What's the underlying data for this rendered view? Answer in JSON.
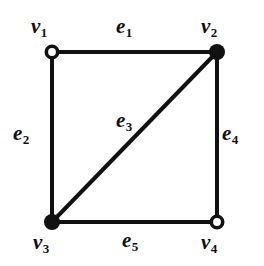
{
  "figure": {
    "kind": "undirected-graph-diagram",
    "background_color": "#ffffff",
    "ink_color": "#111111",
    "width": 264,
    "height": 266
  },
  "vertices": [
    {
      "id": "v1",
      "label": "v",
      "subscript": "1",
      "x": 52,
      "y": 52,
      "fill": "hollow",
      "label_x": 31,
      "label_y": 16
    },
    {
      "id": "v2",
      "label": "v",
      "subscript": "2",
      "x": 217,
      "y": 52,
      "fill": "solid",
      "label_x": 201,
      "label_y": 16
    },
    {
      "id": "v3",
      "label": "v",
      "subscript": "3",
      "x": 52,
      "y": 222,
      "fill": "solid",
      "label_x": 33,
      "label_y": 232
    },
    {
      "id": "v4",
      "label": "v",
      "subscript": "4",
      "x": 217,
      "y": 222,
      "fill": "hollow",
      "label_x": 201,
      "label_y": 232
    }
  ],
  "edges": [
    {
      "id": "e1",
      "label": "e",
      "subscript": "1",
      "from": "v1",
      "to": "v2",
      "label_x": 116,
      "label_y": 16
    },
    {
      "id": "e2",
      "label": "e",
      "subscript": "2",
      "from": "v1",
      "to": "v3",
      "label_x": 13,
      "label_y": 123
    },
    {
      "id": "e3",
      "label": "e",
      "subscript": "3",
      "from": "v3",
      "to": "v2",
      "label_x": 116,
      "label_y": 110
    },
    {
      "id": "e4",
      "label": "e",
      "subscript": "4",
      "from": "v2",
      "to": "v4",
      "label_x": 222,
      "label_y": 123
    },
    {
      "id": "e5",
      "label": "e",
      "subscript": "5",
      "from": "v3",
      "to": "v4",
      "label_x": 122,
      "label_y": 230
    }
  ],
  "style": {
    "edge_stroke_width": 4,
    "node_radius_solid": 8,
    "node_radius_hollow_outer": 7.5,
    "node_hollow_stroke_width": 3.5
  }
}
